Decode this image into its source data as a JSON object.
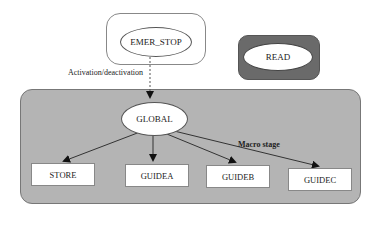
{
  "diagram": {
    "external_nodes": {
      "emer_stop": "EMER_STOP",
      "read": "READ"
    },
    "edge_labels": {
      "activation": "Activation/deactivation",
      "macro_stage": "Macro stage"
    },
    "container": {
      "root": "GLOBAL",
      "children": [
        "STORE",
        "GUIDEA",
        "GUIDEB",
        "GUIDEC"
      ]
    },
    "colors": {
      "container_fill": "#b4b4b4",
      "read_box_fill": "#6a6a6a",
      "node_fill": "#ffffff",
      "edge_color": "#333333"
    }
  }
}
